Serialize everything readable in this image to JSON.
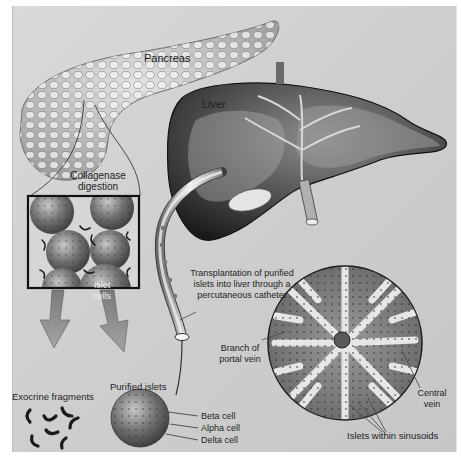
{
  "figure": {
    "type": "medical-illustration",
    "palette": {
      "background": "#d2d2d2",
      "organ_dark": "#2a2a2a",
      "organ_mid": "#8a8a8a",
      "organ_light": "#e8e8e8",
      "text": "#1e1e1e"
    }
  },
  "labels": {
    "pancreas": "Pancreas",
    "liver": "Liver",
    "collagenase_1": "Collagenase",
    "collagenase_2": "digestion",
    "islet_1": "Islet",
    "islet_2": "cells",
    "transplant_1": "Transplantation of purified",
    "transplant_2": "islets into liver through a",
    "transplant_3": "percutaneous catheter",
    "branch_1": "Branch of",
    "branch_2": "portal vein",
    "exocrine": "Exocrine fragments",
    "purified": "Purified islets",
    "beta": "Beta cell",
    "alpha": "Alpha cell",
    "delta": "Delta cell",
    "central_1": "Central",
    "central_2": "vein",
    "sinusoids": "Islets within sinusoids"
  }
}
